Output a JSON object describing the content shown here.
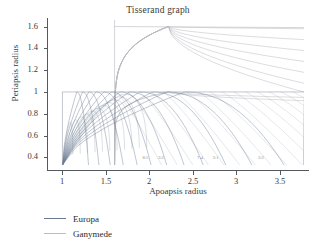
{
  "chart": {
    "title": "Tisserand graph",
    "xlabel": "Apoapsis radius",
    "ylabel": "Periapsis radius"
  },
  "legend": {
    "items": [
      {
        "label": "Europa",
        "color": "#6b7a90"
      },
      {
        "label": "Ganymede",
        "color": "#b9bcc0"
      }
    ]
  },
  "chart_data": {
    "type": "line",
    "title": "Tisserand graph",
    "xlabel": "Apoapsis radius",
    "ylabel": "Periapsis radius",
    "xlim": [
      0.88,
      3.78
    ],
    "ylim": [
      0.33,
      1.66
    ],
    "xticks": [
      1,
      1.5,
      2,
      2.5,
      3,
      3.5
    ],
    "xticklabels": [
      "1",
      "1.5",
      "2",
      "2.5",
      "3",
      "3.5"
    ],
    "yticks": [
      0.4,
      0.6,
      0.8,
      1,
      1.2,
      1.4,
      1.6
    ],
    "yticklabels": [
      "0.4",
      "0.6",
      "0.8",
      "1",
      "1.2",
      "1.4",
      "1.6"
    ],
    "grid": false,
    "legend_position": "below-left",
    "annotations": [
      {
        "text": "8:5",
        "x": 1.92,
        "y": 0.425
      },
      {
        "text": "3:2",
        "x": 2.1,
        "y": 0.425
      },
      {
        "text": "7:4",
        "x": 2.55,
        "y": 0.425
      },
      {
        "text": "2:1",
        "x": 2.73,
        "y": 0.425
      },
      {
        "text": "3:2",
        "x": 3.25,
        "y": 0.425
      }
    ],
    "moon_orbit_radii": {
      "europa": 1.0,
      "ganymede": 1.6
    },
    "series": [
      {
        "name": "Europa",
        "color": "#6b7a90",
        "note": "Tisserand contours tangent to Europa orbit radius 1.0; rise from low periapsis at left, arc over and plateau near periapsis 1.0",
        "curves": [
          {
            "ra_start": 1.0,
            "rp_apex": 1.0,
            "ra_end": 1.3,
            "rp_end": 0.33
          },
          {
            "ra_start": 1.0,
            "rp_apex": 1.0,
            "ra_end": 1.42,
            "rp_end": 0.33
          },
          {
            "ra_start": 1.0,
            "rp_apex": 1.0,
            "ra_end": 1.55,
            "rp_end": 0.33
          },
          {
            "ra_start": 1.0,
            "rp_apex": 1.0,
            "ra_end": 1.7,
            "rp_end": 0.33
          },
          {
            "ra_start": 1.0,
            "rp_apex": 1.0,
            "ra_end": 1.86,
            "rp_end": 0.33
          },
          {
            "ra_start": 1.0,
            "rp_apex": 1.0,
            "ra_end": 2.02,
            "rp_end": 0.33
          },
          {
            "ra_start": 1.0,
            "rp_apex": 1.0,
            "ra_end": 2.2,
            "rp_end": 0.33
          },
          {
            "ra_start": 1.0,
            "rp_apex": 1.0,
            "ra_end": 2.4,
            "rp_end": 0.33
          },
          {
            "ra_start": 1.0,
            "rp_apex": 1.0,
            "ra_end": 2.62,
            "rp_end": 0.33
          },
          {
            "ra_start": 1.0,
            "rp_apex": 1.0,
            "ra_end": 2.88,
            "rp_end": 0.33
          },
          {
            "ra_start": 1.0,
            "rp_apex": 1.0,
            "ra_end": 3.18,
            "rp_end": 0.33
          },
          {
            "ra_start": 1.0,
            "rp_apex": 1.0,
            "ra_end": 3.55,
            "rp_end": 0.33
          }
        ]
      },
      {
        "name": "Ganymede",
        "color": "#b9bcc0",
        "note": "Tisserand contours tangent to Ganymede orbit radius 1.6; family sweeps up to periapsis 1.6 at apoapsis 1.6 and extends right toward the plot edge",
        "curves": [
          {
            "ra_start": 1.6,
            "rp_apex": 1.6,
            "ra_end": 3.78,
            "rp_end": 1.58
          },
          {
            "ra_start": 1.6,
            "rp_apex": 1.6,
            "ra_end": 3.78,
            "rp_end": 1.48
          },
          {
            "ra_start": 1.6,
            "rp_apex": 1.6,
            "ra_end": 3.78,
            "rp_end": 1.38
          },
          {
            "ra_start": 1.6,
            "rp_apex": 1.6,
            "ra_end": 3.78,
            "rp_end": 1.28
          },
          {
            "ra_start": 1.6,
            "rp_apex": 1.6,
            "ra_end": 3.78,
            "rp_end": 1.18
          },
          {
            "ra_start": 1.6,
            "rp_apex": 1.6,
            "ra_end": 3.78,
            "rp_end": 1.08
          },
          {
            "ra_start": 1.6,
            "rp_apex": 1.6,
            "ra_end": 3.78,
            "rp_end": 1.0
          },
          {
            "ra_start": 1.6,
            "rp_apex": 1.0,
            "ra_end": 3.78,
            "rp_end": 0.95
          },
          {
            "ra_start": 1.6,
            "rp_apex": 1.0,
            "ra_end": 3.78,
            "rp_end": 0.92
          }
        ]
      }
    ]
  }
}
